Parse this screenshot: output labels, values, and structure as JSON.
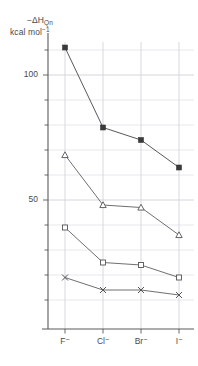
{
  "chart_data": {
    "type": "line",
    "title": "",
    "subtitle": "",
    "xlabel": "",
    "ylabel": "-ΔH_Qn   kcal mol⁻¹",
    "ylabel_symbol_main": "−ΔH",
    "ylabel_symbol_sub": "Qn",
    "ylabel_units_main": "kcal mol",
    "ylabel_units_sup": "−1",
    "categories": [
      "F⁻",
      "Cl⁻",
      "Br⁻",
      "I⁻"
    ],
    "xtick_labels": [
      {
        "base": "F",
        "charge": "−"
      },
      {
        "base": "Cl",
        "charge": "−"
      },
      {
        "base": "Br",
        "charge": "−"
      },
      {
        "base": "I",
        "charge": "−"
      }
    ],
    "ytick_labels": [
      "100",
      "50"
    ],
    "ytick_values": [
      100,
      50
    ],
    "ylim": [
      0,
      130
    ],
    "xlim": [
      -0.35,
      3.35
    ],
    "grid": true,
    "grid_y_values": [
      10,
      20,
      30,
      40,
      50,
      60,
      70,
      80,
      90,
      100,
      110,
      120
    ],
    "grid_y_major": [
      50,
      100
    ],
    "minor_tick_step": 10,
    "legend": "none",
    "legend_position": "none",
    "series": [
      {
        "name": "series-1",
        "marker": "filled-square",
        "color": "#3a3a3a",
        "values": [
          111,
          79,
          74,
          63
        ]
      },
      {
        "name": "series-2",
        "marker": "open-triangle",
        "color": "#555555",
        "values": [
          68,
          48,
          47,
          36
        ]
      },
      {
        "name": "series-3",
        "marker": "open-square",
        "color": "#555555",
        "values": [
          39,
          25,
          24,
          19
        ]
      },
      {
        "name": "series-4",
        "marker": "cross",
        "color": "#555555",
        "values": [
          19,
          14,
          14,
          12
        ]
      }
    ]
  },
  "axes": {
    "y_axis_name": "y-axis",
    "x_axis_name": "x-axis"
  },
  "colors": {
    "background": "#ffffff",
    "axis": "#5a5a5a",
    "grid": "#c9c9d4",
    "text": "#4a4a4a",
    "marker_fill": "#3a3a3a"
  }
}
